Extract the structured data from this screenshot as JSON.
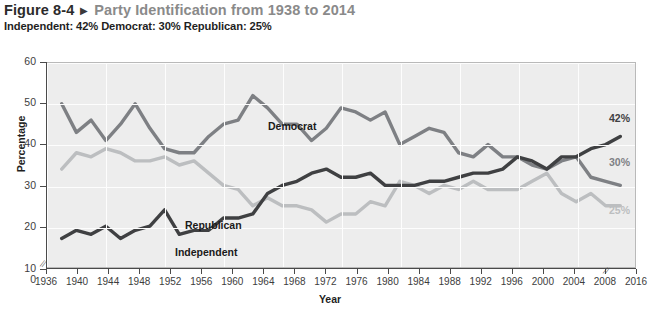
{
  "header": {
    "figure_number": "Figure 8-4",
    "arrow": "▶",
    "title": "Party Identification from 1938 to 2014",
    "subtitle": "Independent: 42% Democrat: 30% Republican: 25%"
  },
  "colors": {
    "independent": "#3f4042",
    "democrat": "#7e8084",
    "republican": "#bcbec0",
    "plot_background": "#ededed",
    "gridline": "#fdfdfd",
    "axis": "#4a4a4a",
    "title_gray": "#8a8a8a"
  },
  "chart_data": {
    "type": "line",
    "title": "Party Identification from 1938 to 2014",
    "xlabel": "Year",
    "ylabel": "Percentage",
    "xlim": [
      1936,
      2016
    ],
    "ylim": [
      10,
      60
    ],
    "yticks": [
      0,
      10,
      20,
      30,
      40,
      50,
      60
    ],
    "xticks": [
      1936,
      1940,
      1944,
      1948,
      1952,
      1956,
      1960,
      1964,
      1968,
      1972,
      1976,
      1980,
      1984,
      1988,
      1992,
      1996,
      2000,
      2004,
      2008,
      2016
    ],
    "grid": true,
    "legend": "inline-labels",
    "axis_break_y": true,
    "axis_break_x": true,
    "x": [
      1938,
      1940,
      1942,
      1944,
      1946,
      1948,
      1950,
      1952,
      1954,
      1956,
      1958,
      1960,
      1962,
      1964,
      1966,
      1968,
      1970,
      1972,
      1974,
      1976,
      1978,
      1980,
      1982,
      1984,
      1986,
      1988,
      1990,
      1992,
      1994,
      1996,
      1998,
      2000,
      2002,
      2004,
      2006,
      2008,
      2010,
      2012,
      2014
    ],
    "series": [
      {
        "name": "Democrat",
        "color": "#7e8084",
        "values": [
          50,
          43,
          46,
          41,
          45,
          50,
          44,
          39,
          38,
          38,
          42,
          45,
          46,
          52,
          49,
          45,
          45,
          41,
          44,
          49,
          48,
          46,
          48,
          40,
          42,
          44,
          43,
          38,
          37,
          40,
          37,
          37,
          35,
          34,
          36,
          37,
          32,
          31,
          30
        ]
      },
      {
        "name": "Republican",
        "color": "#bcbec0",
        "values": [
          34,
          38,
          37,
          39,
          38,
          36,
          36,
          37,
          35,
          36,
          33,
          30,
          29,
          25,
          27,
          25,
          25,
          24,
          21,
          23,
          23,
          26,
          25,
          31,
          30,
          28,
          30,
          29,
          31,
          29,
          29,
          29,
          31,
          33,
          28,
          26,
          28,
          25,
          25
        ]
      },
      {
        "name": "Independent",
        "color": "#3f4042",
        "values": [
          17,
          19,
          18,
          20,
          17,
          19,
          20,
          24,
          18,
          19,
          19,
          22,
          22,
          23,
          28,
          30,
          31,
          33,
          34,
          32,
          32,
          33,
          30,
          30,
          30,
          31,
          31,
          32,
          33,
          33,
          34,
          37,
          36,
          34,
          37,
          37,
          39,
          40,
          42
        ]
      }
    ],
    "end_labels": [
      {
        "text": "42%",
        "series": "Independent",
        "color": "#3f4042"
      },
      {
        "text": "30%",
        "series": "Democrat",
        "color": "#7e8084"
      },
      {
        "text": "25%",
        "series": "Republican",
        "color": "#bcbec0"
      }
    ],
    "inline_labels": [
      {
        "text": "Democrat",
        "series": "Democrat"
      },
      {
        "text": "Republican",
        "series": "Republican"
      },
      {
        "text": "Independent",
        "series": "Independent"
      }
    ]
  }
}
